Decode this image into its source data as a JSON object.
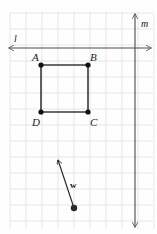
{
  "figure": {
    "width": 157,
    "height": 234,
    "background_color": "#fefefe"
  },
  "grid": {
    "name": "graph-paper-grid",
    "cell_size": 16,
    "origin_x": 10,
    "origin_y": 13,
    "color": "#dcdcdc",
    "line_width": 0.7,
    "visible": true
  },
  "lines": [
    {
      "id": "line-l",
      "label": "l",
      "orientation": "horizontal",
      "color": "#4a4a4a",
      "line_width": 1.1,
      "x1": 9,
      "y1": 48,
      "x2": 151,
      "y2": 48,
      "arrow_start": true,
      "arrow_end": true,
      "label_x": 14,
      "label_y": 42
    },
    {
      "id": "line-m",
      "label": "m",
      "orientation": "vertical",
      "color": "#4a4a4a",
      "line_width": 1.1,
      "x1": 135,
      "y1": 14,
      "x2": 135,
      "y2": 227,
      "arrow_start": true,
      "arrow_end": true,
      "label_x": 141,
      "label_y": 27
    }
  ],
  "square": {
    "id": "square-ABCD",
    "stroke_color": "#3a3a3a",
    "stroke_width": 1.6,
    "fill": "none",
    "vertices": [
      {
        "label": "A",
        "x": 41,
        "y": 65,
        "label_x": 32,
        "label_y": 61,
        "dot_radius": 2.6
      },
      {
        "label": "B",
        "x": 88,
        "y": 65,
        "label_x": 90,
        "label_y": 61,
        "dot_radius": 2.6
      },
      {
        "label": "C",
        "x": 88,
        "y": 112,
        "label_x": 90,
        "label_y": 126,
        "dot_radius": 2.6
      },
      {
        "label": "D",
        "x": 41,
        "y": 112,
        "label_x": 32,
        "label_y": 126,
        "dot_radius": 2.6
      }
    ],
    "dot_color": "#111111"
  },
  "vector": {
    "id": "vector-w",
    "label": "w",
    "tail_x": 74,
    "tail_y": 208,
    "head_x": 58,
    "head_y": 160,
    "color": "#2b2b2b",
    "line_width": 1.2,
    "tail_dot_radius": 3.2,
    "label_x": 70,
    "label_y": 188
  }
}
